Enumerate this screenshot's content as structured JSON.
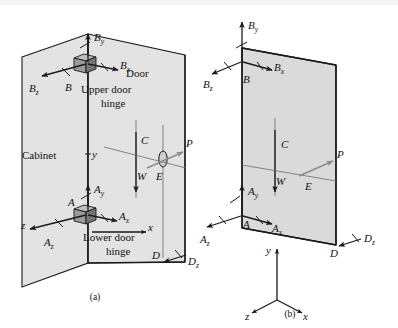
{
  "figure": {
    "captions": [
      {
        "id": "a",
        "text": "(a)"
      },
      {
        "id": "b",
        "text": "(b)"
      }
    ]
  },
  "colors": {
    "panel_fill": "#e3e3e3",
    "panel_stroke": "#1a1a1a",
    "arrow": "#1a1a1a",
    "arrow_applied": "#8a8a8a",
    "hinge_block": "#9a9a9a",
    "background": "#ffffff"
  },
  "diagram_a": {
    "caption": "(a)",
    "annotations": {
      "cabinet": "Cabinet",
      "door": "Door",
      "upper_hinge_line1": "Upper door",
      "upper_hinge_line2": "hinge",
      "lower_hinge_line1": "Lower door",
      "lower_hinge_line2": "hinge"
    },
    "points": [
      {
        "name": "B",
        "label": "B",
        "role": "upper-hinge"
      },
      {
        "name": "A",
        "label": "A",
        "role": "lower-hinge"
      },
      {
        "name": "C",
        "label": "C",
        "role": "centroid-line"
      },
      {
        "name": "E",
        "label": "E",
        "role": "handle"
      },
      {
        "name": "D",
        "label": "D",
        "role": "lower-corner"
      }
    ],
    "forces": [
      {
        "name": "By",
        "base": "B",
        "sub": "y",
        "dir": "up"
      },
      {
        "name": "Bx",
        "base": "B",
        "sub": "x",
        "dir": "right"
      },
      {
        "name": "Bz",
        "base": "B",
        "sub": "z",
        "dir": "left-down"
      },
      {
        "name": "Ay",
        "base": "A",
        "sub": "y",
        "dir": "up"
      },
      {
        "name": "Ax",
        "base": "A",
        "sub": "x",
        "dir": "right"
      },
      {
        "name": "Az",
        "base": "A",
        "sub": "z",
        "dir": "left-down"
      },
      {
        "name": "Dz",
        "base": "D",
        "sub": "z",
        "dir": "left-down"
      },
      {
        "name": "W",
        "base": "W",
        "sub": "",
        "dir": "down"
      },
      {
        "name": "P",
        "base": "P",
        "sub": "",
        "dir": "right-up"
      }
    ],
    "axes": [
      {
        "label": "x",
        "dir": "right"
      },
      {
        "label": "y",
        "dir": "up"
      },
      {
        "label": "z",
        "dir": "left-down"
      }
    ]
  },
  "diagram_b": {
    "caption": "(b)",
    "points": [
      {
        "name": "B",
        "label": "B",
        "role": "upper-hinge"
      },
      {
        "name": "A",
        "label": "A",
        "role": "lower-hinge"
      },
      {
        "name": "C",
        "label": "C",
        "role": "centroid-line"
      },
      {
        "name": "E",
        "label": "E",
        "role": "handle"
      },
      {
        "name": "D",
        "label": "D",
        "role": "lower-corner"
      }
    ],
    "forces": [
      {
        "name": "By",
        "base": "B",
        "sub": "y",
        "dir": "up"
      },
      {
        "name": "Bx",
        "base": "B",
        "sub": "x",
        "dir": "right-down"
      },
      {
        "name": "Bz",
        "base": "B",
        "sub": "z",
        "dir": "left-down"
      },
      {
        "name": "Ay",
        "base": "A",
        "sub": "y",
        "dir": "up"
      },
      {
        "name": "Ax",
        "base": "A",
        "sub": "x",
        "dir": "right-down"
      },
      {
        "name": "Az",
        "base": "A",
        "sub": "z",
        "dir": "left-down"
      },
      {
        "name": "Dz",
        "base": "D",
        "sub": "z",
        "dir": "left-down"
      },
      {
        "name": "W",
        "base": "W",
        "sub": "",
        "dir": "down"
      },
      {
        "name": "P",
        "base": "P",
        "sub": "",
        "dir": "right-up"
      }
    ],
    "axes": [
      {
        "label": "y",
        "dir": "up"
      },
      {
        "label": "x",
        "dir": "right-down"
      },
      {
        "label": "z",
        "dir": "left-down"
      }
    ]
  }
}
